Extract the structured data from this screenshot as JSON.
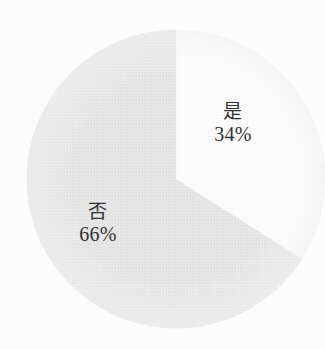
{
  "chart_data": {
    "type": "pie",
    "title": "",
    "subtitle": "",
    "xlabel": "",
    "ylabel": "",
    "legend": "none",
    "grid": false,
    "categories": [
      "是",
      "否"
    ],
    "values": [
      34,
      66
    ],
    "value_unit": "%",
    "slices": [
      {
        "label": "是",
        "value": 34,
        "value_label": "34%",
        "color": "#fdfdfd",
        "start_angle_deg": 0,
        "sweep_angle_deg": 122.4
      },
      {
        "label": "否",
        "value": 66,
        "value_label": "66%",
        "color": "#e4e4e4",
        "start_angle_deg": 122.4,
        "sweep_angle_deg": 237.6
      }
    ],
    "annotations": [
      {
        "text": "是",
        "sub_text": "34%"
      },
      {
        "text": "否",
        "sub_text": "66%"
      }
    ],
    "geometry": {
      "center_x": 176,
      "center_y": 179,
      "radius": 149
    },
    "colors": {
      "background": "#fefefe",
      "slice_yes": "#fdfdfd",
      "slice_no": "#e4e4e4",
      "text": "#2e2e2e",
      "edge": "#efefef"
    }
  },
  "labels": {
    "yes": {
      "category": "是",
      "percent": "34%"
    },
    "no": {
      "category": "否",
      "percent": "66%"
    }
  }
}
